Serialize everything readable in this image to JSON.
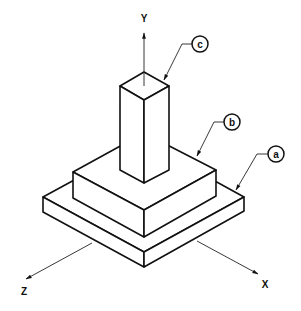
{
  "diagram": {
    "type": "isometric-technical-drawing",
    "axes": [
      {
        "id": "y",
        "label": "Y"
      },
      {
        "id": "z",
        "label": "Z"
      },
      {
        "id": "x",
        "label": "X"
      }
    ],
    "parts": [
      {
        "id": "a",
        "label": "a",
        "name": "base plate"
      },
      {
        "id": "b",
        "label": "b",
        "name": "middle block"
      },
      {
        "id": "c",
        "label": "c",
        "name": "column"
      }
    ],
    "colors": {
      "line": "#111111",
      "background": "#ffffff"
    }
  }
}
